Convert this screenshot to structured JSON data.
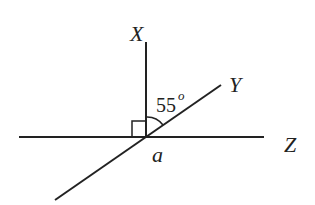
{
  "diagram": {
    "labels": {
      "x": "X",
      "y": "Y",
      "z": "Z",
      "vertex": "a",
      "angle_value": "55",
      "angle_unit": "o"
    },
    "angle_measure": "55°",
    "right_angle_marker": true,
    "line_color": "#222222"
  }
}
